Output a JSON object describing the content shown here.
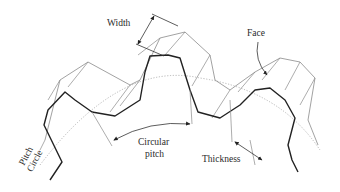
{
  "diagram": {
    "labels": {
      "width": "Width",
      "face": "Face",
      "pitch_circle_line1": "Pitch",
      "pitch_circle_line2": "Circle",
      "circular_pitch_line1": "Circular",
      "circular_pitch_line2": "pitch",
      "thickness": "Thickness"
    },
    "colors": {
      "front_profile": "#222222",
      "back_profile": "#7a7a7a",
      "pitch_circle": "#9a9a9a",
      "background": "#ffffff"
    }
  }
}
